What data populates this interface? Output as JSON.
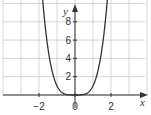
{
  "chart_data": {
    "type": "line",
    "title": "",
    "function": "y = x^4",
    "xlabel": "x",
    "ylabel": "y",
    "xlim": [
      -3.5,
      3.5
    ],
    "ylim": [
      -0.5,
      10
    ],
    "x_ticks": [
      -2,
      0,
      2
    ],
    "x_tick_labels": [
      "−2",
      "0",
      "2"
    ],
    "y_ticks": [
      2,
      4,
      6,
      8
    ],
    "y_tick_labels": [
      "2",
      "4",
      "6",
      "8"
    ],
    "grid": true,
    "grid_x_step": 1,
    "grid_y_step": 2,
    "series": [
      {
        "name": "y = x^4",
        "x": [
          -1.78,
          -1.5,
          -1,
          -0.5,
          0,
          0.5,
          1,
          1.5,
          1.78
        ],
        "y": [
          10,
          5.06,
          1,
          0.06,
          0,
          0.06,
          1,
          5.06,
          10
        ]
      }
    ],
    "colors": {
      "curve": "#333333",
      "grid": "#cccccc",
      "axes": "#333333"
    }
  }
}
